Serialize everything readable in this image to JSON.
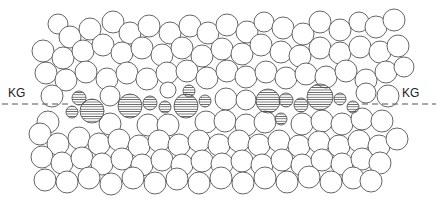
{
  "diagram": {
    "label_left": "KG",
    "label_right": "KG",
    "line_y": 104,
    "stroke_color": "#555555",
    "hatch_color": "#444444",
    "hatched_grains": [
      [
        79,
        98,
        7
      ],
      [
        72,
        112,
        6
      ],
      [
        92,
        111,
        12
      ],
      [
        130,
        106,
        12
      ],
      [
        150,
        103,
        7
      ],
      [
        165,
        107,
        6
      ],
      [
        186,
        106,
        12
      ],
      [
        189,
        91,
        6
      ],
      [
        205,
        101,
        6
      ],
      [
        268,
        101,
        12
      ],
      [
        286,
        100,
        7
      ],
      [
        301,
        105,
        7
      ],
      [
        320,
        97,
        13
      ],
      [
        340,
        99,
        6
      ],
      [
        353,
        107,
        6
      ],
      [
        281,
        119,
        6
      ]
    ],
    "plain_grains": [
      [
        58,
        24,
        10
      ],
      [
        70,
        37,
        11
      ],
      [
        90,
        29,
        11
      ],
      [
        113,
        22,
        11
      ],
      [
        130,
        33,
        11
      ],
      [
        149,
        26,
        11
      ],
      [
        170,
        33,
        11
      ],
      [
        190,
        26,
        11
      ],
      [
        208,
        33,
        11
      ],
      [
        227,
        25,
        11
      ],
      [
        247,
        32,
        11
      ],
      [
        264,
        22,
        10
      ],
      [
        283,
        28,
        11
      ],
      [
        303,
        34,
        11
      ],
      [
        320,
        22,
        11
      ],
      [
        340,
        30,
        11
      ],
      [
        359,
        22,
        10
      ],
      [
        376,
        27,
        11
      ],
      [
        394,
        20,
        11
      ],
      [
        43,
        51,
        11
      ],
      [
        63,
        58,
        11
      ],
      [
        83,
        51,
        11
      ],
      [
        103,
        45,
        11
      ],
      [
        122,
        53,
        11
      ],
      [
        142,
        48,
        11
      ],
      [
        162,
        55,
        11
      ],
      [
        182,
        48,
        11
      ],
      [
        202,
        56,
        11
      ],
      [
        222,
        49,
        11
      ],
      [
        242,
        54,
        11
      ],
      [
        261,
        45,
        11
      ],
      [
        281,
        52,
        11
      ],
      [
        300,
        56,
        11
      ],
      [
        320,
        48,
        11
      ],
      [
        340,
        53,
        11
      ],
      [
        360,
        47,
        11
      ],
      [
        380,
        52,
        11
      ],
      [
        398,
        46,
        11
      ],
      [
        46,
        73,
        11
      ],
      [
        66,
        80,
        11
      ],
      [
        86,
        72,
        11
      ],
      [
        107,
        79,
        11
      ],
      [
        127,
        73,
        11
      ],
      [
        147,
        79,
        11
      ],
      [
        167,
        73,
        11
      ],
      [
        187,
        71,
        11
      ],
      [
        207,
        78,
        11
      ],
      [
        227,
        71,
        11
      ],
      [
        246,
        77,
        11
      ],
      [
        266,
        72,
        11
      ],
      [
        286,
        78,
        11
      ],
      [
        306,
        74,
        11
      ],
      [
        326,
        77,
        11
      ],
      [
        346,
        71,
        11
      ],
      [
        366,
        80,
        11
      ],
      [
        386,
        72,
        11
      ],
      [
        404,
        67,
        10
      ],
      [
        52,
        96,
        11
      ],
      [
        110,
        96,
        10
      ],
      [
        168,
        90,
        8
      ],
      [
        226,
        99,
        11
      ],
      [
        246,
        100,
        10
      ],
      [
        366,
        93,
        10
      ],
      [
        388,
        96,
        11
      ],
      [
        48,
        122,
        11
      ],
      [
        110,
        124,
        11
      ],
      [
        148,
        125,
        11
      ],
      [
        168,
        125,
        11
      ],
      [
        206,
        122,
        11
      ],
      [
        225,
        121,
        11
      ],
      [
        246,
        125,
        11
      ],
      [
        265,
        122,
        11
      ],
      [
        302,
        124,
        11
      ],
      [
        322,
        121,
        11
      ],
      [
        342,
        124,
        11
      ],
      [
        362,
        119,
        11
      ],
      [
        382,
        121,
        11
      ],
      [
        40,
        134,
        11
      ],
      [
        58,
        144,
        11
      ],
      [
        79,
        138,
        11
      ],
      [
        99,
        144,
        11
      ],
      [
        119,
        140,
        11
      ],
      [
        139,
        146,
        11
      ],
      [
        159,
        141,
        11
      ],
      [
        179,
        145,
        11
      ],
      [
        199,
        141,
        11
      ],
      [
        219,
        145,
        11
      ],
      [
        239,
        141,
        11
      ],
      [
        259,
        145,
        11
      ],
      [
        279,
        141,
        11
      ],
      [
        299,
        146,
        11
      ],
      [
        319,
        142,
        11
      ],
      [
        339,
        146,
        11
      ],
      [
        359,
        141,
        11
      ],
      [
        379,
        146,
        11
      ],
      [
        397,
        139,
        11
      ],
      [
        42,
        157,
        11
      ],
      [
        62,
        163,
        11
      ],
      [
        82,
        158,
        11
      ],
      [
        102,
        164,
        11
      ],
      [
        122,
        159,
        11
      ],
      [
        142,
        165,
        11
      ],
      [
        162,
        160,
        11
      ],
      [
        182,
        165,
        11
      ],
      [
        202,
        161,
        11
      ],
      [
        222,
        164,
        11
      ],
      [
        242,
        161,
        11
      ],
      [
        262,
        165,
        11
      ],
      [
        282,
        160,
        11
      ],
      [
        302,
        165,
        11
      ],
      [
        322,
        160,
        11
      ],
      [
        342,
        164,
        11
      ],
      [
        362,
        159,
        11
      ],
      [
        380,
        163,
        11
      ],
      [
        45,
        180,
        11
      ],
      [
        67,
        182,
        11
      ],
      [
        89,
        178,
        11
      ],
      [
        111,
        184,
        11
      ],
      [
        133,
        178,
        11
      ],
      [
        155,
        183,
        11
      ],
      [
        177,
        179,
        11
      ],
      [
        199,
        183,
        11
      ],
      [
        221,
        178,
        11
      ],
      [
        243,
        183,
        11
      ],
      [
        265,
        178,
        11
      ],
      [
        287,
        182,
        11
      ],
      [
        309,
        177,
        11
      ],
      [
        331,
        182,
        11
      ],
      [
        353,
        178,
        11
      ],
      [
        371,
        181,
        11
      ]
    ]
  }
}
